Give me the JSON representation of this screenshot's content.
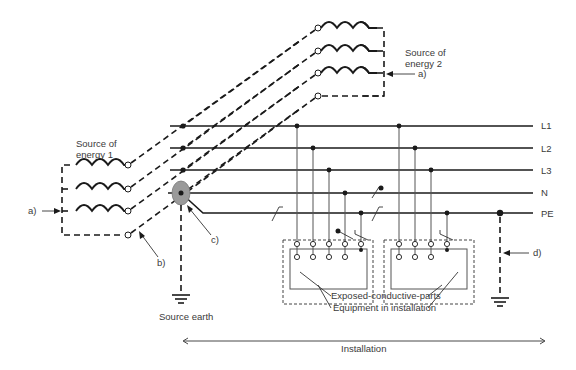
{
  "diagram": {
    "type": "electrical-earthing-system",
    "sources": [
      {
        "id": "source1",
        "label_line1": "Source of",
        "label_line2": "energy 1"
      },
      {
        "id": "source2",
        "label_line1": "Source of",
        "label_line2": "energy 2"
      }
    ],
    "conductors": [
      {
        "id": "L1",
        "label": "L1"
      },
      {
        "id": "L2",
        "label": "L2"
      },
      {
        "id": "L3",
        "label": "L3"
      },
      {
        "id": "N",
        "label": "N"
      },
      {
        "id": "PE",
        "label": "PE"
      }
    ],
    "callouts": {
      "a_left": "a)",
      "a_right": "a)",
      "b": "b)",
      "c": "c)",
      "d": "d)"
    },
    "labels": {
      "source_earth": "Source earth",
      "exposed_parts": "Exposed-conductive-parts",
      "equipment": "Equipment in installation",
      "installation": "Installation"
    },
    "equipment": [
      {
        "id": "equipment1",
        "terminals": 5
      },
      {
        "id": "equipment2",
        "terminals": 4
      }
    ],
    "colors": {
      "line": "#1a1a1a",
      "earth_point": "#9a9a9a",
      "text": "#3a3a3a"
    }
  }
}
